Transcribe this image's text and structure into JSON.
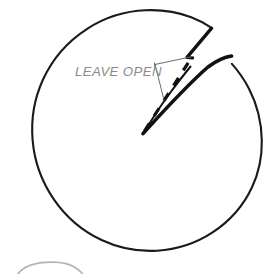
{
  "diagram": {
    "title_label": "LEAVE OPEN",
    "kind": "circle-with-open-wedge",
    "colors": {
      "outline": "#1a1a1a",
      "wedge_stroke": "#111111",
      "dashed_guide": "#111111",
      "leader_line": "#5a5a5a",
      "label_text": "#8a8a8a",
      "background": "#ffffff",
      "faint_arc": "#9a9a9a"
    },
    "geometry": {
      "circle_center_x": 140,
      "circle_center_y": 134,
      "circle_radius": 119,
      "notch_apex_x": 143,
      "notch_apex_y": 133,
      "notch_upper_edge_x": 211,
      "notch_upper_edge_y": 28,
      "notch_lower_edge_x": 232,
      "notch_lower_edge_y": 56,
      "dashed_end_x": 192,
      "dashed_end_y": 58
    },
    "label_position": {
      "x": 75,
      "y": 76
    },
    "leader": {
      "anchor_x": 155,
      "anchor_y": 64,
      "upper_target_x": 192,
      "upper_target_y": 57,
      "lower_target_x": 164,
      "lower_target_y": 99
    }
  }
}
